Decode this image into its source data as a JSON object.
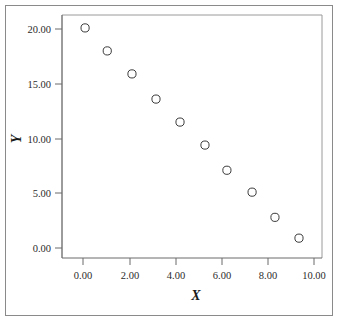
{
  "chart_data": {
    "type": "scatter",
    "title": "",
    "xlabel": "X",
    "ylabel": "Y",
    "xlim": [
      -0.8,
      10.6
    ],
    "ylim": [
      -1.3,
      21.2
    ],
    "xticks": [
      0,
      2,
      4,
      6,
      8,
      10
    ],
    "yticks": [
      0,
      5,
      10,
      15,
      20
    ],
    "xtick_labels": [
      "0.00",
      "2.00",
      "4.00",
      "6.00",
      "8.00",
      "10.00"
    ],
    "ytick_labels": [
      "0.00",
      "5.00",
      "10.00",
      "15.00",
      "20.00"
    ],
    "grid": false,
    "legend": null,
    "marker": "open-circle",
    "marker_color": "#3a3a3a",
    "points": [
      {
        "x": 0.09,
        "y": 20.1
      },
      {
        "x": 1.05,
        "y": 18.0
      },
      {
        "x": 2.12,
        "y": 15.9
      },
      {
        "x": 3.16,
        "y": 13.6
      },
      {
        "x": 4.2,
        "y": 11.5
      },
      {
        "x": 5.28,
        "y": 9.4
      },
      {
        "x": 6.23,
        "y": 7.1
      },
      {
        "x": 7.32,
        "y": 5.1
      },
      {
        "x": 8.31,
        "y": 2.8
      },
      {
        "x": 9.35,
        "y": 0.9
      }
    ]
  },
  "figure": {
    "background_color": "#ffffff",
    "frame_color": "#8a8a8a",
    "axis_color": "#6b6b6b"
  }
}
